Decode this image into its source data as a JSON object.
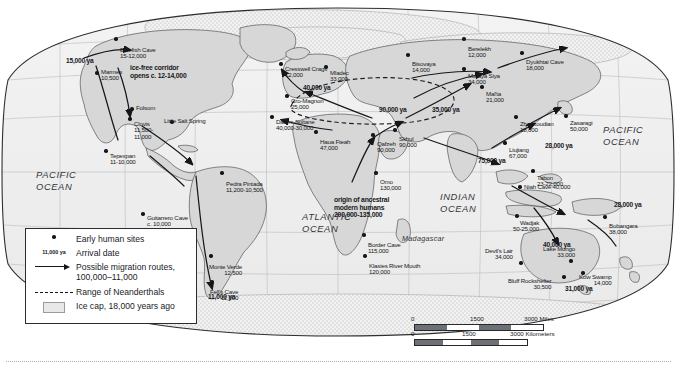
{
  "map": {
    "oceans": [
      {
        "name": "PACIFIC OCEAN",
        "x": 36,
        "y": 163
      },
      {
        "name": "PACIFIC OCEAN",
        "x": 603,
        "y": 118
      },
      {
        "name": "ATLANTIC OCEAN",
        "x": 302,
        "y": 205
      },
      {
        "name": "INDIAN OCEAN",
        "x": 440,
        "y": 185
      },
      {
        "name": "Madagascar",
        "x": 402,
        "y": 229
      }
    ],
    "sites": [
      {
        "name": "Bluefish Cave",
        "date": "15-12,000",
        "x": 116,
        "y": 33,
        "dx": 23,
        "dy": 14
      },
      {
        "name": "Marmes",
        "date": "10,500",
        "x": 97,
        "y": 67,
        "dx": 22,
        "dy": 2
      },
      {
        "name": "Folsom",
        "date": "",
        "x": 132,
        "y": 103,
        "dx": 17,
        "dy": 2
      },
      {
        "name": "Clovis",
        "date": "11,500-\n11,000",
        "x": 130,
        "y": 113,
        "dx": 14,
        "dy": 8
      },
      {
        "name": "Little Salt Spring",
        "date": "",
        "x": 172,
        "y": 116,
        "dx": -8,
        "dy": 2
      },
      {
        "name": "Tepexpan",
        "date": "11-10,000",
        "x": 106,
        "y": 145,
        "dx": 30,
        "dy": 8
      },
      {
        "name": "Pedra Pintada",
        "date": "11,200-10,500",
        "x": 222,
        "y": 167,
        "dx": 2,
        "dy": 14
      },
      {
        "name": "Guitarrero Cave",
        "date": "c. 10,000",
        "x": 143,
        "y": 208,
        "dx": 34,
        "dy": 7
      },
      {
        "name": "Monte Verde",
        "date": "12,500",
        "x": 211,
        "y": 250,
        "dx": -2,
        "dy": 14
      },
      {
        "name": "Fell's Cave",
        "date": "11,000",
        "x": 212,
        "y": 276,
        "dx": -2,
        "dy": 13
      },
      {
        "name": "Cresswell Crags",
        "date": "12,000",
        "x": 281,
        "y": 58,
        "dx": 40,
        "dy": 8
      },
      {
        "name": "Mladec",
        "date": "33,000",
        "x": 326,
        "y": 61,
        "dx": 12,
        "dy": 9
      },
      {
        "name": "Cro-Magnon",
        "date": "25,000",
        "x": 287,
        "y": 90,
        "dx": 36,
        "dy": 8
      },
      {
        "name": "Dar es-Soltane",
        "date": "40,000-30,000",
        "x": 272,
        "y": 111,
        "dx": 45,
        "dy": 8
      },
      {
        "name": "Haua Fteah",
        "date": "47,000",
        "x": 316,
        "y": 126,
        "dx": 16,
        "dy": 13
      },
      {
        "name": "Qafzeh",
        "date": "90,000",
        "x": 373,
        "y": 129,
        "dx": 6,
        "dy": 12
      },
      {
        "name": "Skhul",
        "date": "90,000",
        "x": 395,
        "y": 124,
        "dx": 2,
        "dy": 12
      },
      {
        "name": "Omo",
        "date": "130,000",
        "x": 376,
        "y": 167,
        "dx": 2,
        "dy": 12
      },
      {
        "name": "Border Cave",
        "date": "115,000",
        "x": 364,
        "y": 229,
        "dx": 2,
        "dy": 13
      },
      {
        "name": "Klasies River Mouth",
        "date": "120,000",
        "x": 365,
        "y": 250,
        "dx": 2,
        "dy": 13
      },
      {
        "name": "Berelekh",
        "date": "12,000",
        "x": 464,
        "y": 33,
        "dx": 2,
        "dy": 13
      },
      {
        "name": "Bisovaya",
        "date": "14,000",
        "x": 408,
        "y": 49,
        "dx": 2,
        "dy": 12
      },
      {
        "name": "Mataya Siya",
        "date": "34,000",
        "x": 464,
        "y": 63,
        "dx": 4,
        "dy": 10
      },
      {
        "name": "Dyukhtai Cave",
        "date": "18,000",
        "x": 522,
        "y": 47,
        "dx": 4,
        "dy": 12
      },
      {
        "name": "Mal'ta",
        "date": "21,000",
        "x": 482,
        "y": 81,
        "dx": 4,
        "dy": 10
      },
      {
        "name": "Zhoukoudian",
        "date": "18,000",
        "x": 516,
        "y": 111,
        "dx": 4,
        "dy": 10
      },
      {
        "name": "Zasaragi",
        "date": "50,000",
        "x": 566,
        "y": 110,
        "dx": 4,
        "dy": 10
      },
      {
        "name": "Liujiang",
        "date": "67,000",
        "x": 505,
        "y": 137,
        "dx": 4,
        "dy": 10
      },
      {
        "name": "Tabon",
        "date": "23-22,000",
        "x": 533,
        "y": 165,
        "dx": 2,
        "dy": 10
      },
      {
        "name": "Niah Cave 40,000",
        "date": "",
        "x": 520,
        "y": 181,
        "dx": 4,
        "dy": 3
      },
      {
        "name": "Wadjak",
        "date": "50-25,000",
        "x": 517,
        "y": 210,
        "dx": -4,
        "dy": 10
      },
      {
        "name": "Bobangara",
        "date": "38,000",
        "x": 605,
        "y": 211,
        "dx": 2,
        "dy": 12
      },
      {
        "name": "Devil's Lair",
        "date": "34,000",
        "x": 521,
        "y": 257,
        "dx": -36,
        "dy": -9
      },
      {
        "name": "Lake Mungo",
        "date": "33,000",
        "x": 571,
        "y": 255,
        "dx": -28,
        "dy": -9
      },
      {
        "name": "Kow Swamp",
        "date": "14,000",
        "x": 583,
        "y": 267,
        "dx": -4,
        "dy": 7
      },
      {
        "name": "Bluff Rockshelter",
        "date": "30,500",
        "x": 564,
        "y": 271,
        "dx": -56,
        "dy": 7
      }
    ],
    "migration_labels": [
      {
        "text": "15,000 ya",
        "x": 66,
        "y": 52
      },
      {
        "text": "11,000 ya",
        "x": 208,
        "y": 288
      },
      {
        "text": "40,000 ya",
        "x": 303,
        "y": 79
      },
      {
        "text": "90,000 ya",
        "x": 379,
        "y": 101
      },
      {
        "text": "35,000 ya",
        "x": 432,
        "y": 101
      },
      {
        "text": "28,000 ya",
        "x": 545,
        "y": 137
      },
      {
        "text": "75,000 ya",
        "x": 478,
        "y": 152
      },
      {
        "text": "28,000 ya",
        "x": 614,
        "y": 196
      },
      {
        "text": "40,000 ya",
        "x": 543,
        "y": 236
      },
      {
        "text": "31,000 ya",
        "x": 565,
        "y": 280
      }
    ],
    "annotations": {
      "ice_corridor": "ice-free corridor\nopens c. 12-14,000",
      "ice_corridor_x": 130,
      "ice_corridor_y": 58,
      "origin": "origin of ancestral\nmodern humans\n200,000-135,000",
      "origin_x": 334,
      "origin_y": 190
    }
  },
  "legend": {
    "rows": [
      {
        "key": "dot",
        "label": "Early human sites"
      },
      {
        "key": "date",
        "keytext": "11,000 ya",
        "label": "Arrival date"
      },
      {
        "key": "arrow",
        "label": "Possible migration routes,\n100,000–11,000"
      },
      {
        "key": "dash",
        "label": "Range of Neanderthals"
      },
      {
        "key": "ice",
        "label": "Ice cap, 18,000 years ago"
      }
    ]
  },
  "scale": {
    "miles": {
      "zero": "0",
      "mid": "1500",
      "end": "3000 Miles"
    },
    "kilometers": {
      "zero": "0",
      "mid": "1500",
      "end": "3000 Kilometers"
    }
  }
}
